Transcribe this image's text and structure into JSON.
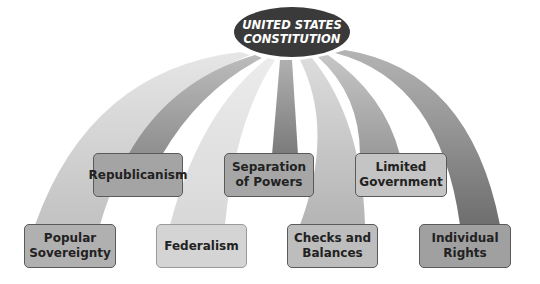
{
  "title": {
    "line1": "UNITED STATES",
    "line2": "CONSTITUTION"
  },
  "upper_boxes": [
    {
      "line1": "Republicanism",
      "line2": ""
    },
    {
      "line1": "Separation",
      "line2": "of Powers"
    },
    {
      "line1": "Limited",
      "line2": "Government"
    }
  ],
  "lower_boxes": [
    {
      "line1": "Popular",
      "line2": "Sovereignty"
    },
    {
      "line1": "Federalism",
      "line2": ""
    },
    {
      "line1": "Checks and",
      "line2": "Balances"
    },
    {
      "line1": "Individual",
      "line2": "Rights"
    }
  ],
  "colors": {
    "oval": "#3a3a3a",
    "box_popular": "#b0b0b0",
    "box_republicanism": "#a4a4a4",
    "box_federalism": "#d4d4d4",
    "box_separation": "#a6a6a6",
    "box_checks": "#bdbdbd",
    "box_limited": "#c4c4c4",
    "box_individual": "#a0a0a0"
  }
}
